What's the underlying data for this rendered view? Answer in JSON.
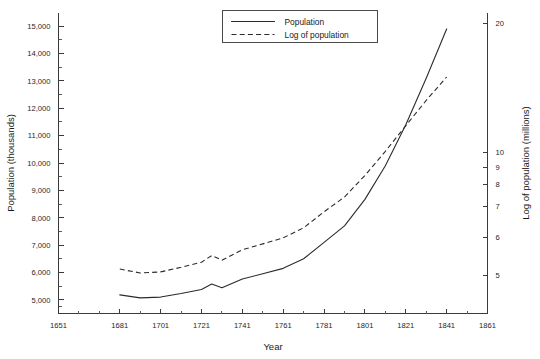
{
  "chart_data": {
    "type": "line",
    "title": "",
    "xlabel": "Year",
    "ylabel": "Population (thousands)",
    "ylabel_right": "Log of population (millions)",
    "grid": false,
    "legend_position": "top-right",
    "xlim": [
      1651,
      1861
    ],
    "xticks": [
      1651,
      1681,
      1701,
      1721,
      1741,
      1761,
      1781,
      1801,
      1821,
      1841,
      1861
    ],
    "xticks_minor": [
      1661,
      1671,
      1691,
      1711,
      1731,
      1751,
      1771,
      1791,
      1811,
      1831,
      1851
    ],
    "ylim": [
      4500,
      15500
    ],
    "yticks": [
      5000,
      6000,
      7000,
      8000,
      9000,
      10000,
      11000,
      12000,
      13000,
      14000,
      15000
    ],
    "ytick_labels": [
      "5,000",
      "6,000",
      "7,000",
      "8,000",
      "9,000",
      "10,000",
      "11,000",
      "12,000",
      "13,000",
      "14,000",
      "15,000"
    ],
    "yticks_right": [
      5,
      6,
      7,
      8,
      9,
      10,
      20
    ],
    "ytick_labels_right": [
      "5",
      "6",
      "7",
      "8",
      "9",
      "10",
      "20"
    ],
    "right_axis_scale": "log",
    "x": [
      1681,
      1691,
      1701,
      1711,
      1721,
      1726,
      1731,
      1741,
      1751,
      1761,
      1771,
      1781,
      1791,
      1801,
      1811,
      1821,
      1831,
      1841
    ],
    "series": [
      {
        "name": "Population",
        "style": "solid",
        "axis": "left",
        "values": [
          5180,
          5070,
          5100,
          5230,
          5380,
          5580,
          5440,
          5760,
          5950,
          6150,
          6500,
          7100,
          7700,
          8670,
          9900,
          11400,
          13100,
          14900
        ]
      },
      {
        "name": "Log of population",
        "style": "dashed",
        "axis": "right",
        "values": [
          5.18,
          5.07,
          5.1,
          5.23,
          5.38,
          5.58,
          5.44,
          5.76,
          5.95,
          6.15,
          6.5,
          7.1,
          7.7,
          8.67,
          9.9,
          11.4,
          13.1,
          14.9
        ]
      }
    ],
    "legend": [
      "Population",
      "Log of population"
    ]
  },
  "axes": {
    "x_title": "Year",
    "y_left_title": "Population (thousands)",
    "y_right_title": "Log of population (millions)"
  },
  "legend": {
    "items": [
      {
        "label": "Population",
        "style": "solid"
      },
      {
        "label": "Log of population",
        "style": "dashed"
      }
    ]
  }
}
